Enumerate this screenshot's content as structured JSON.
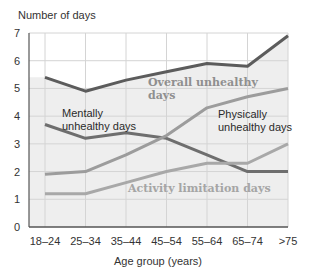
{
  "chart_data": {
    "type": "line",
    "title": "",
    "ylabel": "Number of days",
    "xlabel": "Age group (years)",
    "ylim": [
      0,
      7
    ],
    "yticks": [
      0,
      1,
      2,
      3,
      4,
      5,
      6,
      7
    ],
    "grid": true,
    "legend": "inline annotations",
    "categories": [
      "18–24",
      "25–34",
      "35–44",
      "45–54",
      "55–64",
      "65–74",
      ">75"
    ],
    "series": [
      {
        "name": "Overall unhealthy days",
        "values": [
          5.4,
          4.9,
          5.3,
          5.6,
          5.9,
          5.8,
          6.9
        ],
        "color": "#5c5c5c"
      },
      {
        "name": "Mentally unhealthy days",
        "values": [
          3.7,
          3.2,
          3.4,
          3.2,
          2.6,
          2.0,
          2.0
        ],
        "color": "#6e6e6e"
      },
      {
        "name": "Physically unhealthy days",
        "values": [
          1.9,
          2.0,
          2.6,
          3.3,
          4.3,
          4.7,
          5.0
        ],
        "color": "#9c9c9c"
      },
      {
        "name": "Activity limitation days",
        "values": [
          1.2,
          1.2,
          1.6,
          2.0,
          2.3,
          2.3,
          3.0
        ],
        "color": "#a8a8a8"
      }
    ],
    "annotations": [
      {
        "lines": [
          "Overall unhealthy",
          "days"
        ],
        "style": "serif",
        "color": "#8f8f8f",
        "x": 148,
        "y": 86
      },
      {
        "lines": [
          "Mentally",
          "unhealthy days"
        ],
        "style": "sans",
        "color": "#2a2a2a",
        "x": 62,
        "y": 117
      },
      {
        "lines": [
          "Physically",
          "unhealthy days"
        ],
        "style": "sans",
        "color": "#2a2a2a",
        "x": 218,
        "y": 118
      },
      {
        "lines": [
          "Activity limitation days"
        ],
        "style": "serif",
        "color": "#a5a5a5",
        "x": 128,
        "y": 192
      }
    ]
  },
  "colors": {
    "plot_fill_below_overall": "#eeeeee",
    "grid": "#d4d4d4",
    "axis": "#555555"
  }
}
